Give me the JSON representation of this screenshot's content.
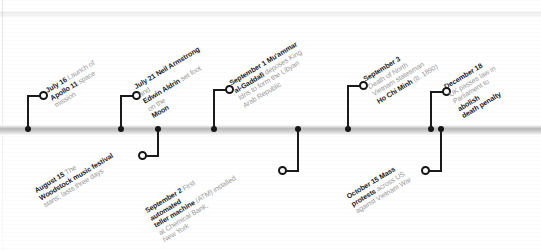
{
  "figure": {
    "name": "timeline-1969",
    "orientation": "horizontal",
    "label_angle_deg": -31,
    "colors": {
      "bar_dark": "#b9b9b9",
      "marker": "#151515",
      "emphasis_text": "#1b1b1b",
      "body_text": "#9a9a9a",
      "background": "#ffffff"
    }
  },
  "events": [
    {
      "id": "apollo-11-launch",
      "side": "above",
      "date": "July 16",
      "lines": [
        {
          "bold": "July 16",
          "rest": " Launch of"
        },
        {
          "bold": "Apollo 11",
          "rest": " space"
        },
        {
          "bold": "",
          "rest": "mission"
        }
      ]
    },
    {
      "id": "moon-landing",
      "side": "above",
      "date": "July 21",
      "lines": [
        {
          "bold": "July 21 Neil Armstrong",
          "rest": ""
        },
        {
          "bold": "",
          "rest": "and "
        },
        {
          "bold": "Edwin Aldrin",
          "rest": " set foot"
        },
        {
          "bold": "",
          "rest": "on the "
        },
        {
          "bold": "Moon",
          "rest": ""
        }
      ]
    },
    {
      "id": "gaddafi-libya",
      "side": "above",
      "date": "September 1",
      "lines": [
        {
          "bold": "September 1 Mu'ammar",
          "rest": ""
        },
        {
          "bold": "al-Gaddafi",
          "rest": " deposes King"
        },
        {
          "bold": "",
          "rest": "Idris to form the Libyan"
        },
        {
          "bold": "",
          "rest": "Arab Republic"
        }
      ]
    },
    {
      "id": "ho-chi-minh-death",
      "side": "above",
      "date": "September 3",
      "lines": [
        {
          "bold": "September 3",
          "rest": ""
        },
        {
          "bold": "",
          "rest": "Death of North"
        },
        {
          "bold": "",
          "rest": "Vietnam statesman"
        },
        {
          "bold": "Ho Chi Minh",
          "rest": " (b. 1890)"
        }
      ]
    },
    {
      "id": "uk-death-penalty-abolished",
      "side": "above",
      "date": "December 18",
      "lines": [
        {
          "bold": "December 18",
          "rest": ""
        },
        {
          "bold": "",
          "rest": "UK passes law in"
        },
        {
          "bold": "",
          "rest": "Parliament to "
        },
        {
          "bold": "abolish",
          "rest": ""
        },
        {
          "bold": "death penalty",
          "rest": ""
        }
      ]
    },
    {
      "id": "woodstock-festival",
      "side": "below",
      "date": "August 15",
      "lines": [
        {
          "bold": "August 15",
          "rest": " The"
        },
        {
          "bold": "Woodstock music festival",
          "rest": ""
        },
        {
          "bold": "",
          "rest": "starts; lasts three days"
        }
      ]
    },
    {
      "id": "first-atm",
      "side": "below",
      "date": "September 2",
      "lines": [
        {
          "bold": "September 2",
          "rest": " First "
        },
        {
          "bold": "automated",
          "rest": ""
        },
        {
          "bold": "teller machine",
          "rest": " (ATM) installed"
        },
        {
          "bold": "",
          "rest": "at Chemical Bank,"
        },
        {
          "bold": "",
          "rest": "New York"
        }
      ]
    },
    {
      "id": "vietnam-war-protests",
      "side": "below",
      "date": "October 15",
      "lines": [
        {
          "bold": "October 15 Mass",
          "rest": ""
        },
        {
          "bold": "protests",
          "rest": " across US"
        },
        {
          "bold": "",
          "rest": "against Vietnam War"
        }
      ]
    }
  ]
}
